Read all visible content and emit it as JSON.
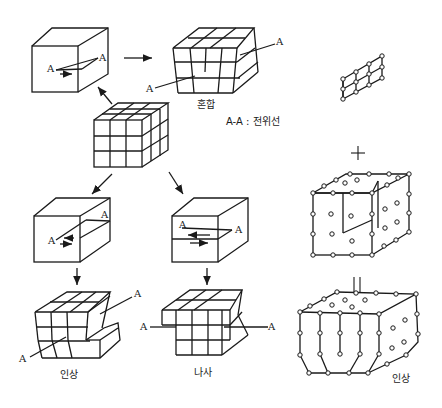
{
  "diagram": {
    "title": "",
    "legend": "A-A : 전위선",
    "point_label": "A",
    "captions": {
      "mixed": "혼합",
      "edge_left": "인상",
      "screw": "나사",
      "edge_right": "인상"
    },
    "operators": {
      "plus": "+",
      "equals": "||"
    },
    "nodes": [
      {
        "id": "perfect-lattice",
        "description": "3x3x3 perfect crystal lattice cube"
      },
      {
        "id": "mixed-schematic",
        "description": "Block with curved dislocation line A-A, slip arrows"
      },
      {
        "id": "mixed-lattice",
        "caption": "혼합"
      },
      {
        "id": "edge-schematic",
        "description": "Block with edge dislocation, slip plane, A-A line"
      },
      {
        "id": "edge-lattice",
        "caption": "인상"
      },
      {
        "id": "screw-schematic",
        "description": "Block with screw dislocation, slip plane, A-A line"
      },
      {
        "id": "screw-lattice",
        "caption": "나사"
      },
      {
        "id": "extra-half-plane",
        "description": "2x2 atom plane inserted"
      },
      {
        "id": "host-crystal",
        "description": "Crystal with cut for inserting half plane"
      },
      {
        "id": "edge-result",
        "caption": "인상"
      }
    ]
  }
}
